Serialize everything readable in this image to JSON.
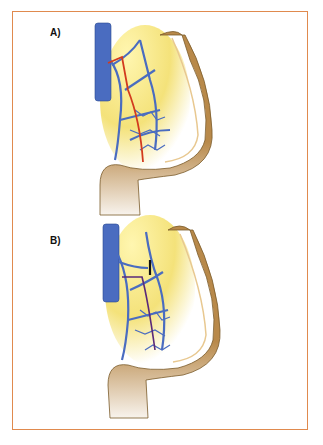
{
  "figure": {
    "panels": [
      {
        "label": "A)",
        "description": "Colon with mesenteric vessels; red line indicating resection/ligation path along vessel"
      },
      {
        "label": "B)",
        "description": "Colon with mesenteric vessels; purple line indicating vessel path with black tie mark"
      }
    ],
    "colors": {
      "border": "#e08a4e",
      "vein": "#4a6cc0",
      "colon": "#b8894a",
      "mesentery": "#f4e27a",
      "line_a": "#d23a1e",
      "line_b": "#5a2a7a",
      "tie": "#111111"
    }
  }
}
